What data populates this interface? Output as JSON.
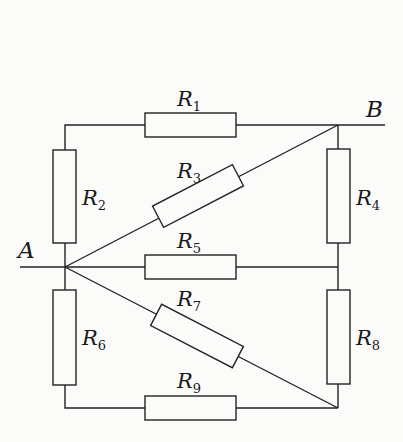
{
  "diagram": {
    "type": "resistor-network",
    "nodes": [
      {
        "id": "A",
        "label": "A"
      },
      {
        "id": "B",
        "label": "B"
      }
    ],
    "resistors": [
      {
        "id": "R1",
        "label": "R",
        "sub": "1"
      },
      {
        "id": "R2",
        "label": "R",
        "sub": "2"
      },
      {
        "id": "R3",
        "label": "R",
        "sub": "3"
      },
      {
        "id": "R4",
        "label": "R",
        "sub": "4"
      },
      {
        "id": "R5",
        "label": "R",
        "sub": "5"
      },
      {
        "id": "R6",
        "label": "R",
        "sub": "6"
      },
      {
        "id": "R7",
        "label": "R",
        "sub": "7"
      },
      {
        "id": "R8",
        "label": "R",
        "sub": "8"
      },
      {
        "id": "R9",
        "label": "R",
        "sub": "9"
      }
    ],
    "colors": {
      "line": "#222222",
      "background": "#fbfbf9"
    }
  }
}
